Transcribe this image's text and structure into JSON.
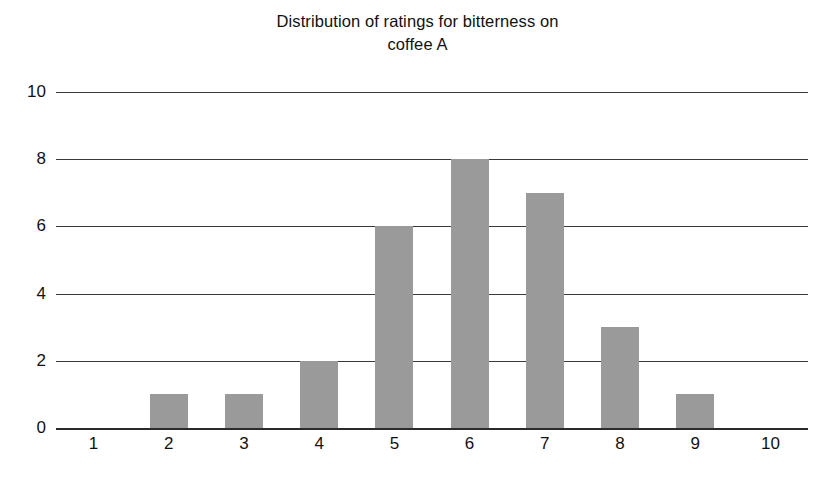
{
  "chart_data": {
    "type": "bar",
    "title": "Distribution of ratings for bitterness on\ncoffee A",
    "title_line1": "Distribution of ratings for bitterness on",
    "title_line2": "coffee A",
    "xlabel": "",
    "ylabel": "",
    "categories": [
      "1",
      "2",
      "3",
      "4",
      "5",
      "6",
      "7",
      "8",
      "9",
      "10"
    ],
    "values": [
      0,
      1,
      1,
      2,
      6,
      8,
      7,
      3,
      1,
      0
    ],
    "ylim": [
      0,
      10
    ],
    "yticks": [
      "0",
      "2",
      "4",
      "6",
      "8",
      "10"
    ],
    "ytick_values": [
      0,
      2,
      4,
      6,
      8,
      10
    ],
    "grid": true,
    "legend": false,
    "bar_color": "#9a9a9a",
    "gridline_color": "#3a3a3a",
    "axis_color": "#2b2b2b",
    "text_color": "#111111"
  }
}
